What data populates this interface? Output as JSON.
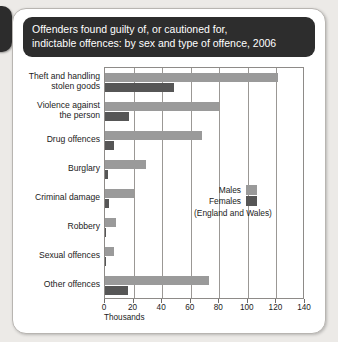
{
  "card": {
    "title_line1": "Offenders found guilty of, or cautioned for,",
    "title_line2": "indictable offences: by sex and type of offence, 2006"
  },
  "legend": {
    "males_label": "Males",
    "females_label": "Females",
    "note": "(England and Wales)"
  },
  "chart_data": {
    "type": "bar",
    "orientation": "horizontal",
    "title": "Offenders found guilty of, or cautioned for, indictable offences: by sex and type of offence, 2006",
    "subtitle": "(England and Wales)",
    "xlabel": "Thousands",
    "ylabel": "",
    "xlim": [
      0,
      140
    ],
    "xticks": [
      0,
      20,
      40,
      60,
      80,
      100,
      120,
      140
    ],
    "xtick_labels": [
      "0",
      "20",
      "40",
      "60",
      "80",
      "100",
      "120",
      "140"
    ],
    "grid": "vertical",
    "legend_position": "inside-right",
    "categories": [
      "Theft and handling stolen goods",
      "Violence against the person",
      "Drug offences",
      "Burglary",
      "Criminal damage",
      "Robbery",
      "Sexual offences",
      "Other offences"
    ],
    "category_lines": [
      [
        "Theft and handling",
        "stolen goods"
      ],
      [
        "Violence against",
        "the person"
      ],
      [
        "Drug offences"
      ],
      [
        "Burglary"
      ],
      [
        "Criminal damage"
      ],
      [
        "Robbery"
      ],
      [
        "Sexual offences"
      ],
      [
        "Other offences"
      ]
    ],
    "series": [
      {
        "name": "Males",
        "color": "#9a9a9a",
        "values": [
          121,
          80,
          68,
          29,
          20,
          8,
          6,
          73
        ]
      },
      {
        "name": "Females",
        "color": "#565656",
        "values": [
          48,
          17,
          6,
          2,
          3,
          1,
          0.3,
          16
        ]
      }
    ]
  }
}
